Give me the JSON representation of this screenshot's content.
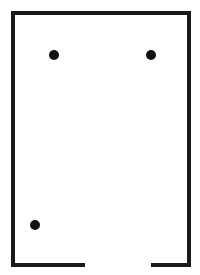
{
  "diagram": {
    "type": "room-floor-plan",
    "canvas": {
      "width": 200,
      "height": 275,
      "background": "#ffffff"
    },
    "stroke_color": "#1a1a1a",
    "stroke_width": 4,
    "walls": {
      "left_x": 13,
      "right_x": 189,
      "top_y": 13,
      "bottom_y": 265,
      "door_gap": {
        "start_x": 85,
        "end_x": 151
      }
    },
    "points": [
      {
        "id": "point-1",
        "cx": 54,
        "cy": 55,
        "r": 5,
        "color": "#111111"
      },
      {
        "id": "point-2",
        "cx": 151,
        "cy": 55,
        "r": 5,
        "color": "#111111"
      },
      {
        "id": "point-3",
        "cx": 35,
        "cy": 225,
        "r": 5,
        "color": "#111111"
      }
    ]
  }
}
